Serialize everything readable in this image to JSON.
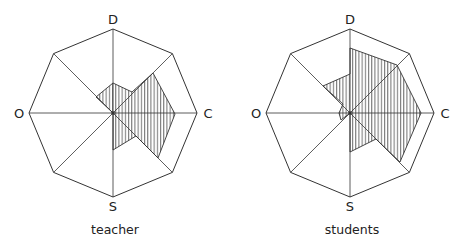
{
  "diagrams": [
    {
      "id": "teacher",
      "caption": "teacher",
      "center": [
        113,
        113
      ],
      "radius": 84,
      "axis_labels": {
        "top": "D",
        "right": "C",
        "bottom": "S",
        "left": "O"
      },
      "shaded_polygon": [
        [
          113,
          113
        ],
        [
          96,
          97
        ],
        [
          113,
          83
        ],
        [
          132,
          92
        ],
        [
          153,
          73
        ],
        [
          175,
          114
        ],
        [
          158,
          158
        ],
        [
          136,
          136
        ],
        [
          113,
          150
        ]
      ]
    },
    {
      "id": "students",
      "caption": "students",
      "center": [
        350,
        113
      ],
      "radius": 84,
      "axis_labels": {
        "top": "D",
        "right": "C",
        "bottom": "S",
        "left": "O"
      },
      "shaded_polygon": [
        [
          350,
          113
        ],
        [
          341,
          120
        ],
        [
          339,
          113
        ],
        [
          343,
          104
        ],
        [
          323,
          86
        ],
        [
          350,
          74
        ],
        [
          350,
          48
        ],
        [
          397,
          65
        ],
        [
          421,
          113
        ],
        [
          400,
          162
        ],
        [
          376,
          139
        ],
        [
          350,
          152
        ]
      ]
    }
  ],
  "colors": {
    "line": "#333333",
    "hatch": "#333333",
    "background": "#ffffff"
  }
}
